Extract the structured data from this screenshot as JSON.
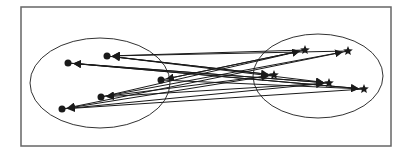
{
  "diagram": {
    "type": "bipartite-arrow-diagram",
    "frame": {
      "x": 21,
      "y": 7,
      "w": 370,
      "h": 139,
      "stroke": "#666666"
    },
    "clusters": [
      {
        "id": "left",
        "shape": "ellipse",
        "cx": 100,
        "cy": 83,
        "rx": 70,
        "ry": 45,
        "node_marker": "filled-dot"
      },
      {
        "id": "right",
        "shape": "ellipse",
        "cx": 318,
        "cy": 76,
        "rx": 65,
        "ry": 42,
        "node_marker": "star"
      }
    ],
    "nodes": [
      {
        "id": "L1",
        "cluster": "left",
        "x": 68,
        "y": 63
      },
      {
        "id": "L2",
        "cluster": "left",
        "x": 107,
        "y": 56
      },
      {
        "id": "L3",
        "cluster": "left",
        "x": 161,
        "y": 80
      },
      {
        "id": "L4",
        "cluster": "left",
        "x": 101,
        "y": 97
      },
      {
        "id": "L5",
        "cluster": "left",
        "x": 62,
        "y": 109
      },
      {
        "id": "R1",
        "cluster": "right",
        "x": 305,
        "y": 50
      },
      {
        "id": "R2",
        "cluster": "right",
        "x": 348,
        "y": 51
      },
      {
        "id": "R3",
        "cluster": "right",
        "x": 274,
        "y": 75
      },
      {
        "id": "R4",
        "cluster": "right",
        "x": 329,
        "y": 83
      },
      {
        "id": "R5",
        "cluster": "right",
        "x": 364,
        "y": 89
      }
    ],
    "edges": [
      [
        "R1",
        "L2"
      ],
      [
        "R2",
        "L2"
      ],
      [
        "R3",
        "L2"
      ],
      [
        "R5",
        "L1"
      ],
      [
        "R4",
        "L1"
      ],
      [
        "R1",
        "L3"
      ],
      [
        "R3",
        "L4"
      ],
      [
        "R4",
        "L4"
      ],
      [
        "R5",
        "L5"
      ],
      [
        "R2",
        "L5"
      ],
      [
        "L1",
        "R4"
      ],
      [
        "L2",
        "R3"
      ],
      [
        "L3",
        "R1"
      ],
      [
        "L4",
        "R1"
      ],
      [
        "L5",
        "R4"
      ],
      [
        "L1",
        "R5"
      ],
      [
        "L4",
        "R2"
      ],
      [
        "L2",
        "R4"
      ],
      [
        "L3",
        "R5"
      ],
      [
        "L5",
        "R3"
      ]
    ],
    "colors": {
      "ink": "#1a1a1a",
      "frame": "#666666",
      "background": "#ffffff"
    }
  }
}
